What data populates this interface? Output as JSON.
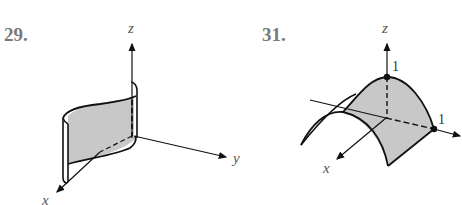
{
  "figures": [
    {
      "number": "29.",
      "axes": {
        "x": "x",
        "y": "y",
        "z": "z"
      },
      "description": "vertical cylindrical sheet (S-shaped trace extruded along z), shaded gray"
    },
    {
      "number": "31.",
      "axes": {
        "x": "x",
        "y": "y",
        "z": "z"
      },
      "tick_labels": {
        "z_intercept": "1",
        "y_intercept": "1"
      },
      "description": "parabolic cylinder opening downward, peak at z=1, meeting y-axis at 1, shaded gray"
    }
  ],
  "colors": {
    "surface_fill": "#c8c8c8",
    "line": "#111111",
    "label": "#7a7a7a"
  }
}
